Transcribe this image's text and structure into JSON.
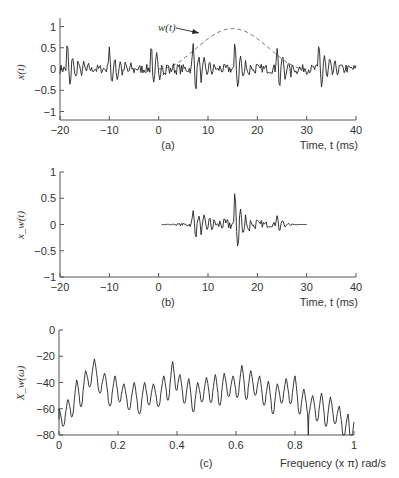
{
  "chart_data": [
    {
      "id": "a",
      "type": "line",
      "panel_label": "(a)",
      "ylabel": "x(t)",
      "xlabel": "Time, t (ms)",
      "xlim": [
        -20,
        40
      ],
      "ylim": [
        -1.2,
        1.2
      ],
      "xticks": [
        -20,
        -10,
        0,
        10,
        20,
        30,
        40
      ],
      "yticks": [
        1,
        0.5,
        0,
        -0.5,
        -1
      ],
      "ytick_labels": [
        "1",
        "0.5",
        "0",
        "-0.5",
        "-1"
      ],
      "annotation": "w(t)",
      "series": [
        {
          "name": "x(t)",
          "style": "solid",
          "description": "quasi-periodic voiced speech-like signal with pitch pulses every ~8.5 ms, amplitude ~±0.55"
        },
        {
          "name": "w(t)",
          "style": "dashed",
          "description": "Hann window from t=0 to t=30 ms, peak ~0.95 at t=15"
        }
      ],
      "pulse_times": [
        -18.5,
        -10,
        -1.5,
        7,
        15.5,
        24,
        32.5
      ]
    },
    {
      "id": "b",
      "type": "line",
      "panel_label": "(b)",
      "ylabel": "x_w(t)",
      "xlabel": "Time, t (ms)",
      "xlim": [
        -20,
        40
      ],
      "ylim": [
        -1,
        1
      ],
      "xticks": [
        -20,
        -10,
        0,
        10,
        20,
        30,
        40
      ],
      "yticks": [
        1,
        0.5,
        0,
        -0.5,
        -1
      ],
      "ytick_labels": [
        "1",
        "0.5",
        "0",
        "-0.5",
        "-1"
      ],
      "series": [
        {
          "name": "x_w(t)",
          "style": "solid",
          "description": "windowed signal, nonzero from t=0 to 30 ms, largest pulse ~0.5 near t=15.5"
        }
      ]
    },
    {
      "id": "c",
      "type": "line",
      "panel_label": "(c)",
      "ylabel": "X_w(ω)",
      "xlabel": "Frequency (x π) rad/s",
      "xlim": [
        0,
        1
      ],
      "ylim": [
        -80,
        0
      ],
      "xticks": [
        0,
        0.2,
        0.4,
        0.6,
        0.8,
        1
      ],
      "xtick_labels": [
        "0",
        "0.2",
        "0.4",
        "0.6",
        "0.8",
        "1"
      ],
      "yticks": [
        0,
        -20,
        -40,
        -60,
        -80
      ],
      "ytick_labels": [
        "0",
        "-20",
        "-40",
        "-60",
        "-80"
      ],
      "series": [
        {
          "name": "|X_w(ω)| dB",
          "style": "solid",
          "peaks_x": [
            0.0,
            0.03,
            0.06,
            0.09,
            0.12,
            0.155,
            0.19,
            0.22,
            0.255,
            0.29,
            0.32,
            0.355,
            0.385,
            0.41,
            0.44,
            0.47,
            0.5,
            0.53,
            0.56,
            0.59,
            0.62,
            0.65,
            0.68,
            0.71,
            0.74,
            0.77,
            0.8,
            0.83,
            0.86,
            0.89,
            0.92,
            0.95,
            0.98
          ],
          "peaks_y": [
            -60,
            -53,
            -38,
            -31,
            -22,
            -33,
            -35,
            -41,
            -40,
            -40,
            -41,
            -35,
            -24,
            -34,
            -37,
            -40,
            -36,
            -34,
            -33,
            -35,
            -27,
            -31,
            -35,
            -39,
            -41,
            -37,
            -35,
            -45,
            -50,
            -48,
            -51,
            -58,
            -64
          ]
        }
      ]
    }
  ]
}
